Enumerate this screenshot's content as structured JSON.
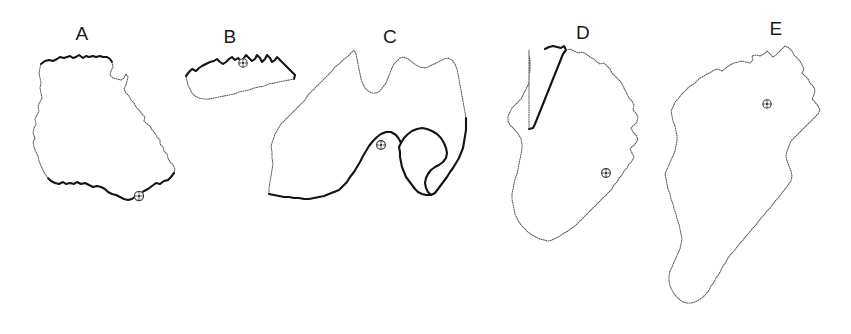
{
  "figure": {
    "title": "",
    "background_color": "#ffffff",
    "coast_color": "#141414",
    "inland_color": "#5a5a5a",
    "marker_color": "#3a3a3a",
    "marker_icon": "capital-city-circle-icon"
  },
  "shapes": [
    {
      "id": "A",
      "label": "A",
      "label_x": 82,
      "label_y": 40,
      "marker_x": 139,
      "marker_y": 196,
      "has_marker": true
    },
    {
      "id": "B",
      "label": "B",
      "label_x": 230,
      "label_y": 43,
      "marker_x": 243,
      "marker_y": 63,
      "has_marker": true
    },
    {
      "id": "C",
      "label": "C",
      "label_x": 390,
      "label_y": 43,
      "marker_x": 381,
      "marker_y": 145,
      "has_marker": true
    },
    {
      "id": "D",
      "label": "D",
      "label_x": 583,
      "label_y": 39,
      "marker_x": 606,
      "marker_y": 173,
      "has_marker": true
    },
    {
      "id": "E",
      "label": "E",
      "label_x": 776,
      "label_y": 35,
      "marker_x": 767,
      "marker_y": 104,
      "has_marker": true
    }
  ],
  "chart_data": {
    "type": "map",
    "title": "",
    "categories": [
      "A",
      "B",
      "C",
      "D",
      "E"
    ],
    "items": [
      {
        "label": "A",
        "marker_count": 1,
        "coastline": "southern and northern edges bold",
        "inland_border": "eastern and western edges dotted"
      },
      {
        "label": "B",
        "marker_count": 1,
        "coastline": "northern edge bold",
        "inland_border": "southern edge dotted"
      },
      {
        "label": "C",
        "marker_count": 1,
        "coastline": "southern edge bold",
        "inland_border": "northern edge dotted"
      },
      {
        "label": "D",
        "marker_count": 1,
        "coastline": "north-western edge bold",
        "inland_border": "remaining edges dotted"
      },
      {
        "label": "E",
        "marker_count": 1,
        "coastline": "none",
        "inland_border": "entire outline dotted"
      }
    ],
    "xlabel": "",
    "ylabel": "",
    "legend": []
  }
}
